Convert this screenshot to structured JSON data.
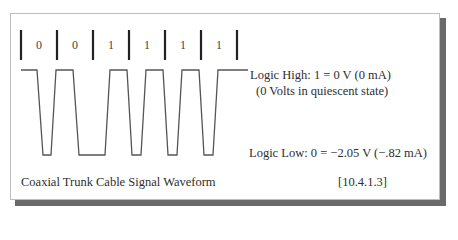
{
  "diagram": {
    "title": "Coaxial Trunk Cable Signal Waveform",
    "reference": "[10.4.1.3]",
    "bits": [
      "0",
      "0",
      "1",
      "1",
      "1",
      "1"
    ],
    "labels": {
      "logic_high": "Logic High: 1 = 0 V  (0 mA)",
      "logic_high_note": "(0 Volts in quiescent state)",
      "logic_low": "Logic Low: 0 = −2.05 V  (−.82 mA)"
    },
    "colors": {
      "waveform": "#555555",
      "divider": "#222222",
      "shadow": "#6a6a6a",
      "border": "#bdbdbd"
    }
  }
}
